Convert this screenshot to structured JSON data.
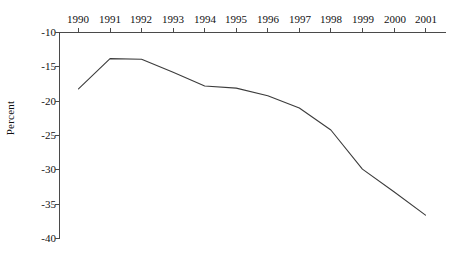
{
  "chart_data": {
    "type": "line",
    "title": "",
    "subtitle": "",
    "xlabel": "",
    "ylabel": "Percent",
    "categories": [
      "1990",
      "1991",
      "1992",
      "1993",
      "1994",
      "1995",
      "1996",
      "1997",
      "1998",
      "1999",
      "2000",
      "2001"
    ],
    "x": [
      1990,
      1991,
      1992,
      1993,
      1994,
      1995,
      1996,
      1997,
      1998,
      1999,
      2000,
      2001
    ],
    "values": [
      -18.2,
      -13.8,
      -13.9,
      -15.8,
      -17.8,
      -18.1,
      -19.2,
      -21.0,
      -24.2,
      -29.9,
      -33.2,
      -36.6
    ],
    "series": [
      {
        "name": "Percent",
        "values": [
          -18.2,
          -13.8,
          -13.9,
          -15.8,
          -17.8,
          -18.1,
          -19.2,
          -21.0,
          -24.2,
          -29.9,
          -33.2,
          -36.6
        ],
        "color": "#3c3c3c"
      }
    ],
    "ylim": [
      -40,
      -10
    ],
    "xlim": [
      1990,
      2001
    ],
    "yticks": [
      -10,
      -15,
      -20,
      -25,
      -30,
      -35,
      -40
    ],
    "ytick_labels": [
      "-10",
      "-15",
      "-20",
      "-25",
      "-30",
      "-35",
      "-40"
    ],
    "xticks": [
      1990,
      1991,
      1992,
      1993,
      1994,
      1995,
      1996,
      1997,
      1998,
      1999,
      2000,
      2001
    ],
    "xtick_labels": [
      "1990",
      "1991",
      "1992",
      "1993",
      "1994",
      "1995",
      "1996",
      "1997",
      "1998",
      "1999",
      "2000",
      "2001"
    ],
    "grid": false,
    "legend": false,
    "legend_position": "none",
    "x_axis_position": "top",
    "y_axis_position": "left",
    "annotations": []
  },
  "axes": {
    "y_label": "Percent",
    "y_ticks": [
      {
        "label": "-10",
        "value": -10
      },
      {
        "label": "-15",
        "value": -15
      },
      {
        "label": "-20",
        "value": -20
      },
      {
        "label": "-25",
        "value": -25
      },
      {
        "label": "-30",
        "value": -30
      },
      {
        "label": "-35",
        "value": -35
      },
      {
        "label": "-40",
        "value": -40
      }
    ],
    "x_ticks": [
      {
        "label": "1990"
      },
      {
        "label": "1991"
      },
      {
        "label": "1992"
      },
      {
        "label": "1993"
      },
      {
        "label": "1994"
      },
      {
        "label": "1995"
      },
      {
        "label": "1996"
      },
      {
        "label": "1997"
      },
      {
        "label": "1998"
      },
      {
        "label": "1999"
      },
      {
        "label": "2000"
      },
      {
        "label": "2001"
      }
    ]
  },
  "colors": {
    "line": "#3c3c3c",
    "axis": "#4a4a4a",
    "text": "#111111",
    "background": "#ffffff"
  }
}
